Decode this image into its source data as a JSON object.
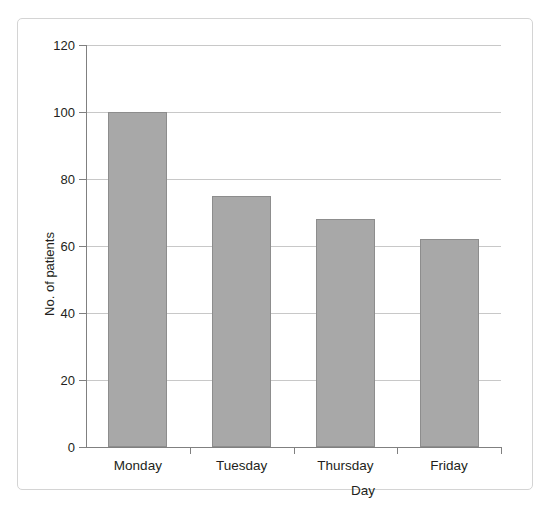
{
  "chart_data": {
    "type": "bar",
    "title": "",
    "xlabel": "Day",
    "ylabel": "No. of patients",
    "categories": [
      "Monday",
      "Tuesday",
      "Thursday",
      "Friday"
    ],
    "values": [
      100,
      75,
      68,
      62
    ],
    "ylim": [
      0,
      120
    ],
    "yticks": [
      0,
      20,
      40,
      60,
      80,
      100,
      120
    ],
    "ytick_labels": [
      "0",
      "20",
      "40",
      "60",
      "80",
      "100",
      "120"
    ],
    "grid": true,
    "legend": null,
    "series": [
      {
        "name": "No. of patients",
        "values": [
          100,
          75,
          68,
          62
        ],
        "color": "#a8a8a8"
      }
    ]
  },
  "figure": {
    "caption": ""
  },
  "colors": {
    "bar_fill": "#a8a8a8",
    "bar_border": "#8d8d8d",
    "gridline": "#c8c8c8",
    "axis": "#808080",
    "frame_border": "#d4d4d4",
    "text": "#231f20"
  }
}
